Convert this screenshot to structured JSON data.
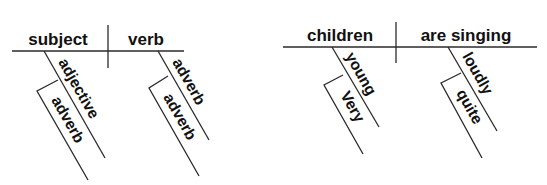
{
  "template_diagram": {
    "subject": "subject",
    "verb": "verb",
    "subject_modifier": "adjective",
    "subject_modifier_modifier": "adverb",
    "verb_modifier": "adverb",
    "verb_modifier_modifier": "adverb"
  },
  "example_diagram": {
    "subject": "children",
    "verb": "are singing",
    "subject_modifier": "young",
    "subject_modifier_modifier": "Very",
    "verb_modifier": "loudly",
    "verb_modifier_modifier": "quite"
  },
  "colors": {
    "line": "#2a2a2a",
    "text": "#111111",
    "background": "#ffffff"
  }
}
